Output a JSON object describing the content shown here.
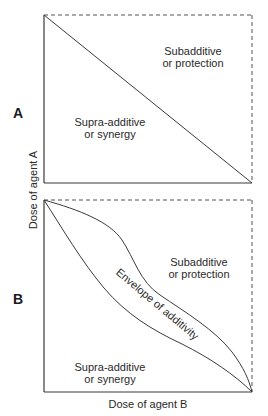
{
  "figure": {
    "x_axis_label": "Dose of agent B",
    "y_axis_label": "Dose of agent A",
    "line_color": "#3a3a3a",
    "dashed_color": "#555555"
  },
  "panel_a": {
    "label": "A",
    "region_upper": {
      "line1": "Subadditive",
      "line2": "or protection"
    },
    "region_lower": {
      "line1": "Supra-additive",
      "line2": "or synergy"
    },
    "line": "straight isobole from top-left to bottom-right"
  },
  "panel_b": {
    "label": "B",
    "region_upper": {
      "line1": "Subadditive",
      "line2": "or protection"
    },
    "region_lower": {
      "line1": "Supra-additive",
      "line2": "or synergy"
    },
    "envelope_label": "Envelope of additivity"
  }
}
